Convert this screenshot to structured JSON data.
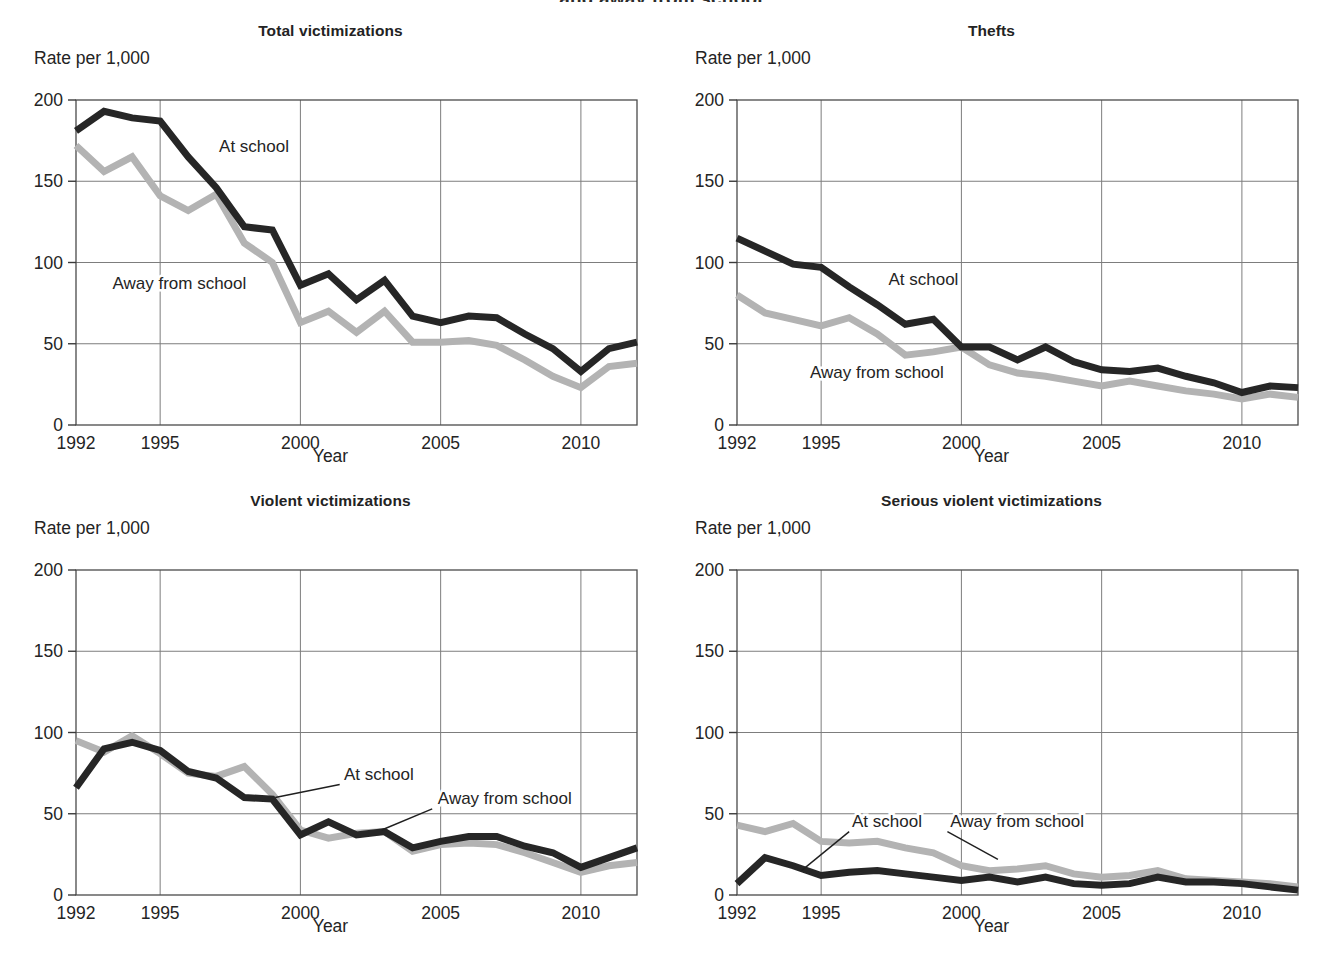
{
  "figure": {
    "clipped_heading": "and away from school",
    "yaxis_caption": "Rate per 1,000",
    "xaxis_label": "Year",
    "y_ticks": [
      "0",
      "50",
      "100",
      "150",
      "200"
    ],
    "x_ticks": [
      "1992",
      "1995",
      "2000",
      "2005",
      "2010"
    ],
    "colors": {
      "at_school": "#262626",
      "away_from_school": "#b3b3b3",
      "grid": "#7d7d7d",
      "frame": "#4a4a4a"
    }
  },
  "chart_data": [
    {
      "type": "line",
      "title": "Total victimizations",
      "xlabel": "Year",
      "ylabel": "Rate per 1,000",
      "ylim": [
        0,
        200
      ],
      "xlim": [
        1992,
        2012
      ],
      "yticks": [
        0,
        50,
        100,
        150,
        200
      ],
      "xticks": [
        1992,
        1995,
        2000,
        2005,
        2010
      ],
      "grid": true,
      "legend": "inline-annotation",
      "x": [
        1992,
        1993,
        1994,
        1995,
        1996,
        1997,
        1998,
        1999,
        2000,
        2001,
        2002,
        2003,
        2004,
        2005,
        2006,
        2007,
        2008,
        2009,
        2010,
        2011,
        2012
      ],
      "series": [
        {
          "name": "At school",
          "color": "#262626",
          "label_x": 1997.1,
          "label_y": 168,
          "leader": null,
          "values": [
            181,
            193,
            189,
            187,
            165,
            146,
            122,
            120,
            86,
            93,
            77,
            89,
            67,
            63,
            67,
            66,
            56,
            47,
            33,
            47,
            51
          ]
        },
        {
          "name": "Away from school",
          "color": "#b3b3b3",
          "label_x": 1993.3,
          "label_y": 84,
          "leader": null,
          "values": [
            172,
            156,
            165,
            141,
            132,
            142,
            112,
            100,
            63,
            70,
            57,
            70,
            51,
            51,
            52,
            49,
            40,
            30,
            23,
            36,
            38
          ]
        }
      ]
    },
    {
      "type": "line",
      "title": "Thefts",
      "xlabel": "Year",
      "ylabel": "Rate per 1,000",
      "ylim": [
        0,
        200
      ],
      "xlim": [
        1992,
        2012
      ],
      "yticks": [
        0,
        50,
        100,
        150,
        200
      ],
      "xticks": [
        1992,
        1995,
        2000,
        2005,
        2010
      ],
      "grid": true,
      "legend": "inline-annotation",
      "x": [
        1992,
        1993,
        1994,
        1995,
        1996,
        1997,
        1998,
        1999,
        2000,
        2001,
        2002,
        2003,
        2004,
        2005,
        2006,
        2007,
        2008,
        2009,
        2010,
        2011,
        2012
      ],
      "series": [
        {
          "name": "At school",
          "color": "#262626",
          "label_x": 1997.4,
          "label_y": 86,
          "leader": null,
          "values": [
            115,
            107,
            99,
            97,
            85,
            74,
            62,
            65,
            48,
            48,
            40,
            48,
            39,
            34,
            33,
            35,
            30,
            26,
            20,
            24,
            23
          ]
        },
        {
          "name": "Away from school",
          "color": "#b3b3b3",
          "label_x": 1994.6,
          "label_y": 29,
          "leader": null,
          "values": [
            80,
            69,
            65,
            61,
            66,
            56,
            43,
            45,
            48,
            37,
            32,
            30,
            27,
            24,
            27,
            24,
            21,
            19,
            16,
            19,
            17
          ]
        }
      ]
    },
    {
      "type": "line",
      "title": "Violent victimizations",
      "xlabel": "Year",
      "ylabel": "Rate per 1,000",
      "ylim": [
        0,
        200
      ],
      "xlim": [
        1992,
        2012
      ],
      "yticks": [
        0,
        50,
        100,
        150,
        200
      ],
      "xticks": [
        1992,
        1995,
        2000,
        2005,
        2010
      ],
      "grid": true,
      "legend": "leader-annotation",
      "x": [
        1992,
        1993,
        1994,
        1995,
        1996,
        1997,
        1998,
        1999,
        2000,
        2001,
        2002,
        2003,
        2004,
        2005,
        2006,
        2007,
        2008,
        2009,
        2010,
        2011,
        2012
      ],
      "series": [
        {
          "name": "At school",
          "color": "#262626",
          "label_x": 2001.55,
          "label_y": 71,
          "leader": [
            [
              2001.4,
              68
            ],
            [
              1999.1,
              60
            ]
          ],
          "values": [
            66,
            90,
            94,
            89,
            76,
            72,
            60,
            59,
            37,
            45,
            37,
            39,
            29,
            33,
            36,
            36,
            30,
            26,
            17,
            23,
            29
          ]
        },
        {
          "name": "Away from school",
          "color": "#b3b3b3",
          "label_x": 2004.9,
          "label_y": 56,
          "leader": [
            [
              2004.7,
              53
            ],
            [
              2002.9,
              40
            ]
          ],
          "values": [
            95,
            88,
            98,
            87,
            75,
            73,
            79,
            62,
            40,
            35,
            38,
            39,
            27,
            31,
            32,
            31,
            26,
            20,
            14,
            18,
            20
          ]
        }
      ]
    },
    {
      "type": "line",
      "title": "Serious violent victimizations",
      "xlabel": "Year",
      "ylabel": "Rate per 1,000",
      "ylim": [
        0,
        200
      ],
      "xlim": [
        1992,
        2012
      ],
      "yticks": [
        0,
        50,
        100,
        150,
        200
      ],
      "xticks": [
        1992,
        1995,
        2000,
        2005,
        2010
      ],
      "grid": true,
      "legend": "leader-annotation",
      "x": [
        1992,
        1993,
        1994,
        1995,
        1996,
        1997,
        1998,
        1999,
        2000,
        2001,
        2002,
        2003,
        2004,
        2005,
        2006,
        2007,
        2008,
        2009,
        2010,
        2011,
        2012
      ],
      "series": [
        {
          "name": "At school",
          "color": "#262626",
          "label_x": 1996.1,
          "label_y": 42,
          "leader": [
            [
              1996.0,
              39
            ],
            [
              1994.3,
              15
            ]
          ],
          "values": [
            7,
            23,
            18,
            12,
            14,
            15,
            13,
            11,
            9,
            11,
            8,
            11,
            7,
            6,
            7,
            11,
            8,
            8,
            7,
            5,
            3
          ]
        },
        {
          "name": "Away from school",
          "color": "#b3b3b3",
          "label_x": 1999.6,
          "label_y": 42,
          "leader": [
            [
              1999.5,
              39
            ],
            [
              2001.3,
              22
            ]
          ],
          "values": [
            43,
            39,
            44,
            33,
            32,
            33,
            29,
            26,
            18,
            15,
            16,
            18,
            13,
            11,
            12,
            15,
            10,
            9,
            8,
            7,
            5
          ]
        }
      ]
    }
  ]
}
